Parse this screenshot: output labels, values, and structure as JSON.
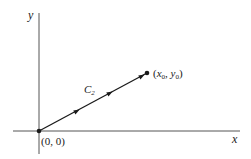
{
  "diagram": {
    "axes": {
      "x_label": "x",
      "y_label": "y"
    },
    "curve": {
      "name": "C",
      "subscript": "2"
    },
    "start_point": {
      "label": "(0, 0)"
    },
    "end_point": {
      "open": "(",
      "x": "x",
      "x_sub": "0",
      "sep": ", ",
      "y": "y",
      "y_sub": "0",
      "close": ")"
    },
    "colors": {
      "stroke": "#1a1a1a",
      "axis": "#555555"
    }
  }
}
